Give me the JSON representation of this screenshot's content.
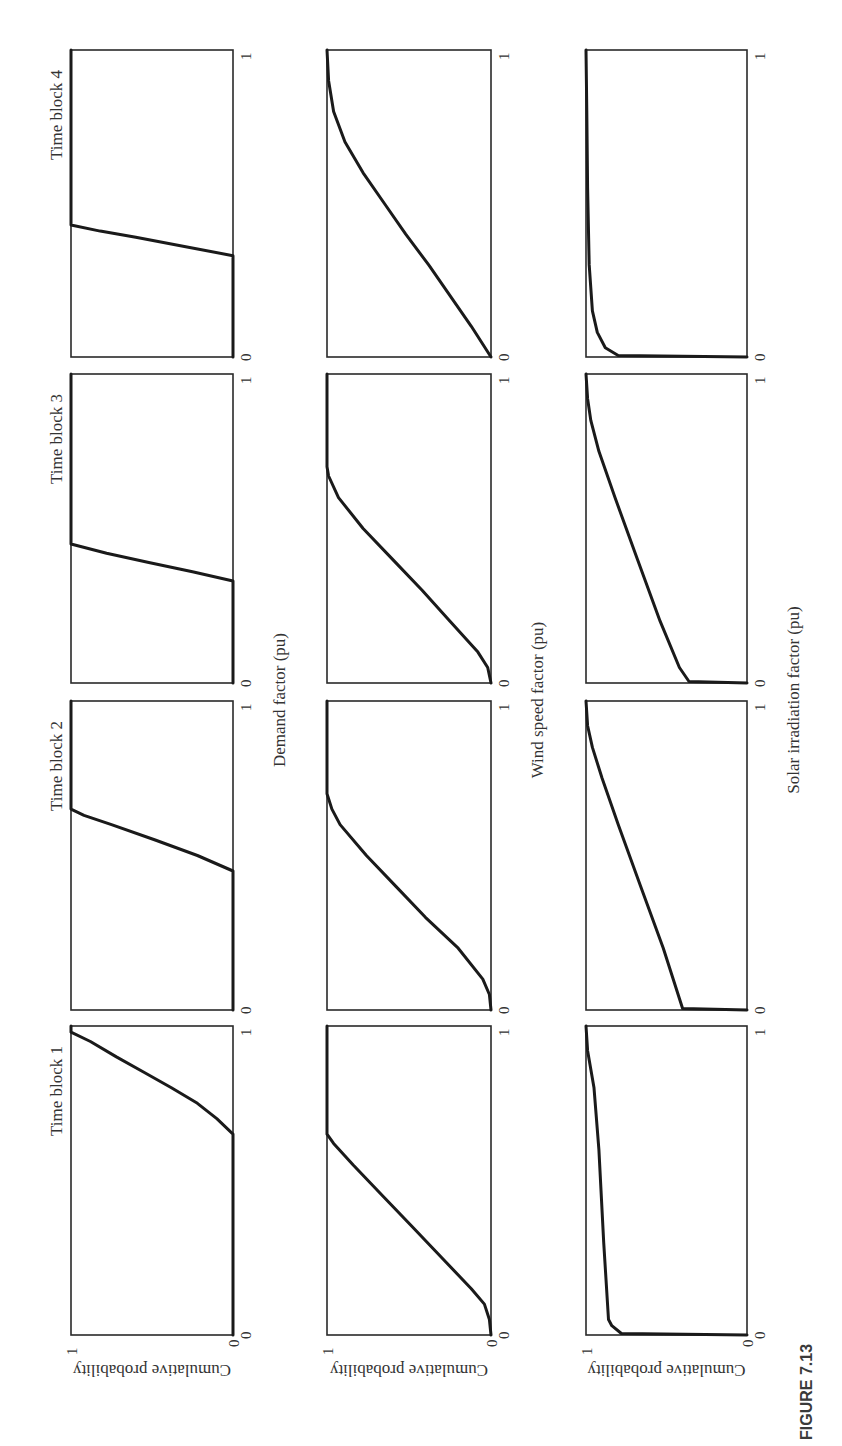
{
  "figure": {
    "caption": "FIGURE 7.13",
    "orientation": "rotated 90° counter-clockwise"
  },
  "labels": {
    "time_blocks": [
      "Time block 1",
      "Time block 2",
      "Time block 3",
      "Time block 4"
    ],
    "row_xlabels": [
      "Demand factor (pu)",
      "Wind speed factor (pu)",
      "Solar irradiation factor (pu)"
    ],
    "ylabel": "Cumulative probability",
    "tick_zero": "0",
    "tick_one": "1"
  },
  "chart_data": {
    "type": "line",
    "layout": {
      "rows": [
        "Demand",
        "Wind speed",
        "Solar irradiation"
      ],
      "columns": [
        "Time block 1",
        "Time block 2",
        "Time block 3",
        "Time block 4"
      ]
    },
    "xlim": [
      0,
      1
    ],
    "ylim": [
      0,
      1
    ],
    "ylabel": "Cumulative probability",
    "grid": false,
    "panels": [
      {
        "row": "Demand",
        "block": "Time block 1",
        "xlabel": "Demand factor (pu)",
        "x": [
          0,
          0.65,
          0.7,
          0.75,
          0.8,
          0.85,
          0.9,
          0.95,
          0.98,
          1.0
        ],
        "y": [
          0,
          0,
          0.1,
          0.22,
          0.38,
          0.55,
          0.72,
          0.88,
          1.0,
          1.0
        ]
      },
      {
        "row": "Demand",
        "block": "Time block 2",
        "xlabel": "Demand factor (pu)",
        "x": [
          0,
          0.45,
          0.5,
          0.55,
          0.6,
          0.63,
          0.65,
          1.0
        ],
        "y": [
          0,
          0,
          0.22,
          0.48,
          0.75,
          0.92,
          1.0,
          1.0
        ]
      },
      {
        "row": "Demand",
        "block": "Time block 3",
        "xlabel": "Demand factor (pu)",
        "x": [
          0,
          0.33,
          0.36,
          0.39,
          0.42,
          0.45,
          1.0
        ],
        "y": [
          0,
          0,
          0.25,
          0.52,
          0.78,
          1.0,
          1.0
        ]
      },
      {
        "row": "Demand",
        "block": "Time block 4",
        "xlabel": "Demand factor (pu)",
        "x": [
          0,
          0.33,
          0.36,
          0.39,
          0.41,
          0.43,
          1.0
        ],
        "y": [
          0,
          0,
          0.3,
          0.6,
          0.82,
          1.0,
          1.0
        ]
      },
      {
        "row": "Wind speed",
        "block": "Time block 1",
        "xlabel": "Wind speed factor (pu)",
        "x": [
          0,
          0.05,
          0.1,
          0.15,
          0.25,
          0.35,
          0.45,
          0.55,
          0.62,
          0.65,
          1.0
        ],
        "y": [
          0,
          0.01,
          0.04,
          0.12,
          0.3,
          0.48,
          0.66,
          0.84,
          0.96,
          1.0,
          1.0
        ]
      },
      {
        "row": "Wind speed",
        "block": "Time block 2",
        "xlabel": "Wind speed factor (pu)",
        "x": [
          0,
          0.05,
          0.1,
          0.2,
          0.3,
          0.4,
          0.5,
          0.6,
          0.65,
          0.7,
          1.0
        ],
        "y": [
          0,
          0.01,
          0.05,
          0.2,
          0.4,
          0.58,
          0.76,
          0.92,
          0.97,
          1.0,
          1.0
        ]
      },
      {
        "row": "Wind speed",
        "block": "Time block 3",
        "xlabel": "Wind speed factor (pu)",
        "x": [
          0,
          0.05,
          0.1,
          0.2,
          0.3,
          0.4,
          0.5,
          0.6,
          0.67,
          0.7,
          1.0
        ],
        "y": [
          0,
          0.02,
          0.08,
          0.25,
          0.42,
          0.6,
          0.78,
          0.93,
          0.99,
          1.0,
          1.0
        ]
      },
      {
        "row": "Wind speed",
        "block": "Time block 4",
        "xlabel": "Wind speed factor (pu)",
        "x": [
          0,
          0.1,
          0.2,
          0.3,
          0.4,
          0.5,
          0.6,
          0.7,
          0.8,
          0.9,
          1.0
        ],
        "y": [
          0,
          0.12,
          0.25,
          0.38,
          0.52,
          0.65,
          0.78,
          0.89,
          0.96,
          0.99,
          1.0
        ]
      },
      {
        "row": "Solar irradiation",
        "block": "Time block 1",
        "xlabel": "Solar irradiation factor (pu)",
        "x": [
          0,
          0.005,
          0.03,
          0.05,
          0.3,
          0.6,
          0.8,
          0.92,
          1.0
        ],
        "y": [
          0,
          0.78,
          0.84,
          0.86,
          0.89,
          0.92,
          0.95,
          0.99,
          1.0
        ]
      },
      {
        "row": "Solar irradiation",
        "block": "Time block 2",
        "xlabel": "Solar irradiation factor (pu)",
        "x": [
          0,
          0.005,
          0.2,
          0.4,
          0.6,
          0.75,
          0.85,
          0.92,
          1.0
        ],
        "y": [
          0,
          0.4,
          0.52,
          0.66,
          0.8,
          0.9,
          0.96,
          0.99,
          1.0
        ]
      },
      {
        "row": "Solar irradiation",
        "block": "Time block 3",
        "xlabel": "Solar irradiation factor (pu)",
        "x": [
          0,
          0.005,
          0.05,
          0.2,
          0.4,
          0.6,
          0.75,
          0.85,
          0.92,
          1.0
        ],
        "y": [
          0,
          0.36,
          0.42,
          0.54,
          0.68,
          0.82,
          0.92,
          0.97,
          0.99,
          1.0
        ]
      },
      {
        "row": "Solar irradiation",
        "block": "Time block 4",
        "xlabel": "Solar irradiation factor (pu)",
        "x": [
          0,
          0.005,
          0.03,
          0.08,
          0.15,
          0.3,
          0.55,
          0.8,
          1.0
        ],
        "y": [
          0,
          0.8,
          0.88,
          0.93,
          0.96,
          0.98,
          0.99,
          0.995,
          1.0
        ]
      }
    ]
  }
}
